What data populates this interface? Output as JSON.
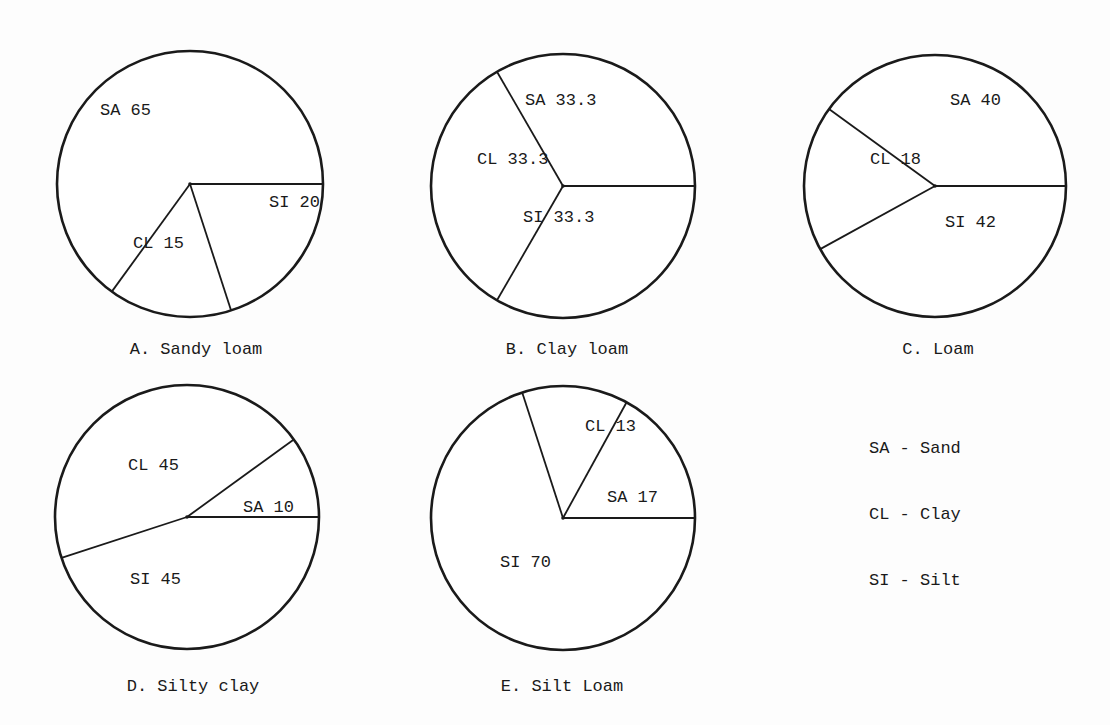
{
  "chart_data": [
    {
      "type": "pie",
      "title": "A. Sandy loam",
      "categories": [
        "SI",
        "CL",
        "SA"
      ],
      "values": [
        20,
        15,
        65
      ],
      "labels": [
        "SI 20",
        "CL 15",
        "SA 65"
      ]
    },
    {
      "type": "pie",
      "title": "B. Clay loam",
      "categories": [
        "SI",
        "CL",
        "SA"
      ],
      "values": [
        33.3,
        33.3,
        33.3
      ],
      "labels": [
        "SI 33.3",
        "CL 33.3",
        "SA 33.3"
      ]
    },
    {
      "type": "pie",
      "title": "C. Loam",
      "categories": [
        "SI",
        "CL",
        "SA"
      ],
      "values": [
        42,
        18,
        40
      ],
      "labels": [
        "SI 42",
        "CL 18",
        "SA 40"
      ]
    },
    {
      "type": "pie",
      "title": "D. Silty clay",
      "categories": [
        "SI",
        "CL",
        "SA"
      ],
      "values": [
        45,
        45,
        10
      ],
      "labels": [
        "SI 45",
        "CL 45",
        "SA 10"
      ]
    },
    {
      "type": "pie",
      "title": "E. Silt Loam",
      "categories": [
        "SI",
        "CL",
        "SA"
      ],
      "values": [
        70,
        13,
        17
      ],
      "labels": [
        "SI 70",
        "CL 13",
        "SA 17"
      ]
    }
  ],
  "legend": [
    {
      "abbr": "SA",
      "name": "Sand",
      "text": "SA - Sand"
    },
    {
      "abbr": "CL",
      "name": "Clay",
      "text": "CL - Clay"
    },
    {
      "abbr": "SI",
      "name": "Silt",
      "text": "SI - Silt"
    }
  ],
  "style": {
    "line_color": "#1a1a1a",
    "fill_color": "#ffffff",
    "background": "#fdfdfd"
  }
}
